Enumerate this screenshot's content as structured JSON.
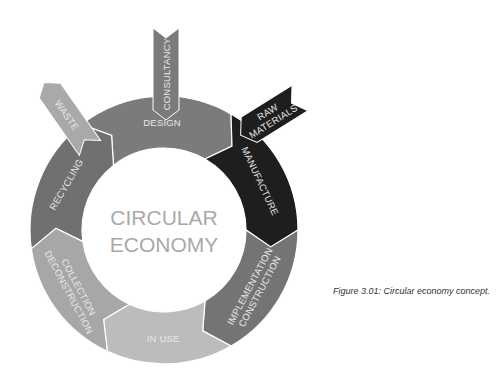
{
  "diagram": {
    "center_label": [
      "CIRCULAR",
      "ECONOMY"
    ],
    "segments": [
      {
        "id": "design",
        "label": [
          "DESIGN"
        ],
        "color": "#7b7b7b"
      },
      {
        "id": "manufacture",
        "label": [
          "MANUFACTURE"
        ],
        "color": "#1e1e1e"
      },
      {
        "id": "implementation",
        "label": [
          "IMPLEMENTATION",
          "CONSTRUCTION"
        ],
        "color": "#747474"
      },
      {
        "id": "in-use",
        "label": [
          "IN USE"
        ],
        "color": "#bcbcbc"
      },
      {
        "id": "collection",
        "label": [
          "COLLECTION",
          "DECONSTRUCTION"
        ],
        "color": "#a7a7a7"
      },
      {
        "id": "recycling",
        "label": [
          "RECYCLING"
        ],
        "color": "#707070"
      }
    ],
    "arrows": [
      {
        "id": "consultancy",
        "label": [
          "CONSULTANCY"
        ],
        "direction": "in",
        "color": "#7b7b7b"
      },
      {
        "id": "raw-materials",
        "label": [
          "RAW",
          "MATERIALS"
        ],
        "direction": "in",
        "color": "#1e1e1e"
      },
      {
        "id": "waste",
        "label": [
          "WASTE"
        ],
        "direction": "out",
        "color": "#a9a9a9"
      }
    ]
  },
  "caption": "Figure 3.01: Circular economy concept."
}
